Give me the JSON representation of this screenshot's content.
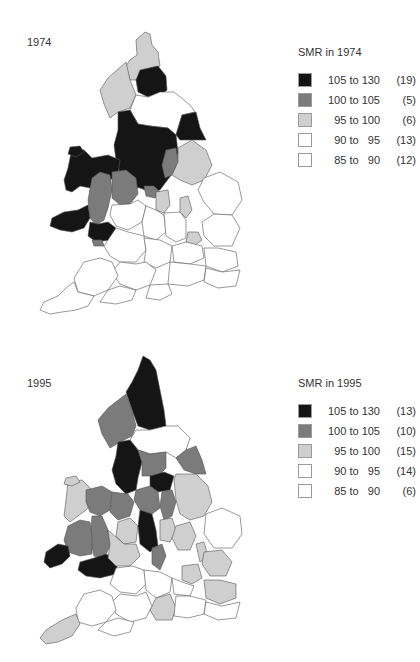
{
  "colors": {
    "c105_130": "#151515",
    "c100_105": "#7b7b7b",
    "c95_100": "#cfcfcf",
    "c90_95": "#ffffff",
    "c85_90": "#ffffff",
    "outline": "#555555"
  },
  "maps": [
    {
      "year_label": "1974",
      "legend": {
        "title": "SMR in 1974",
        "items": [
          {
            "range": "105 to 130",
            "count": "(19)",
            "color": "#151515"
          },
          {
            "range": "100 to 105",
            "count": "(5)",
            "color": "#7b7b7b"
          },
          {
            "range": "95 to 100",
            "count": "(6)",
            "color": "#cfcfcf"
          },
          {
            "range": "90 to   95",
            "count": "(13)",
            "color": "#ffffff"
          },
          {
            "range": "85 to   90",
            "count": "(12)",
            "color": "#ffffff"
          }
        ]
      }
    },
    {
      "year_label": "1995",
      "legend": {
        "title": "SMR in 1995",
        "items": [
          {
            "range": "105 to 130",
            "count": "(13)",
            "color": "#151515"
          },
          {
            "range": "100 to 105",
            "count": "(10)",
            "color": "#7b7b7b"
          },
          {
            "range": "95 to 100",
            "count": "(15)",
            "color": "#cfcfcf"
          },
          {
            "range": "90 to   95",
            "count": "(14)",
            "color": "#ffffff"
          },
          {
            "range": "85 to   90",
            "count": "(6)",
            "color": "#ffffff"
          }
        ]
      }
    }
  ]
}
